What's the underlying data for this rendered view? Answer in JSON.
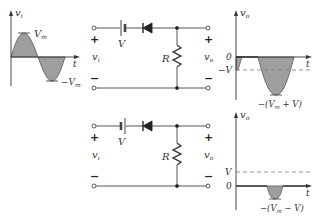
{
  "figure": {
    "type": "series clipper circuits with DC source",
    "colors": {
      "wire": "#444444",
      "fill": "#9e9e9e",
      "axis": "#333333",
      "dashed": "#777777"
    }
  },
  "input_graph": {
    "y_label": "v",
    "y_sub": "i",
    "x_label": "t",
    "peak_label": "V",
    "peak_sub": "m",
    "trough_label": "−V",
    "trough_sub": "m"
  },
  "circuits": [
    {
      "battery_label": "V",
      "resistor_label": "R",
      "plus_left": "+",
      "minus_left": "−",
      "plus_right": "+",
      "minus_right": "−",
      "vin_label": "v",
      "vin_sub": "i",
      "vout_label": "v",
      "vout_sub": "o",
      "battery_orientation": "long-plate-left"
    },
    {
      "battery_label": "V",
      "resistor_label": "R",
      "plus_left": "+",
      "minus_left": "−",
      "plus_right": "+",
      "minus_right": "−",
      "vin_label": "v",
      "vin_sub": "i",
      "vout_label": "v",
      "vout_sub": "o",
      "battery_orientation": "short-plate-left"
    }
  ],
  "output_graphs": [
    {
      "y_label": "v",
      "y_sub": "o",
      "x_label": "t",
      "zero_label": "0",
      "level_label": "−V",
      "min_label": "−(V",
      "min_sub": "m",
      "min_tail": " + V)"
    },
    {
      "y_label": "v",
      "y_sub": "o",
      "x_label": "t",
      "zero_label": "0",
      "level_label": "V",
      "min_label": "−(V",
      "min_sub": "m",
      "min_tail": " − V)"
    }
  ]
}
